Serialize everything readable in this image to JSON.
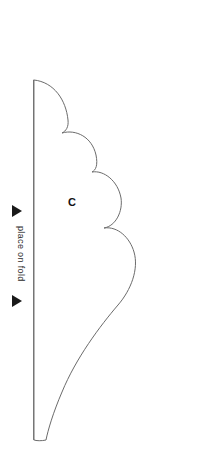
{
  "document": {
    "type": "sewing-pattern-piece",
    "background_color": "#ffffff",
    "width": 202,
    "height": 472
  },
  "pattern_piece": {
    "label": "C",
    "label_x": 71,
    "label_y": 203,
    "outline_color": "#6b6b6b",
    "outline_width": 1,
    "fill": "none",
    "description": "scalloped cloud-shaped half pattern piece cut on fold"
  },
  "fold": {
    "instruction_text": "place on fold",
    "text_color": "#2b2b2b",
    "line_color": "#8a8a8a",
    "line_x": 34,
    "line_top_y": 80,
    "line_bottom_y": 440,
    "arrow_color": "#1a1a1a",
    "arrow_glyph": "▶",
    "top_arrow": {
      "x": 12,
      "y": 210
    },
    "bottom_arrow": {
      "x": 12,
      "y": 300
    },
    "text_x": 14,
    "text_y": 228,
    "text_rotation_deg": 90
  },
  "geometry": {
    "fold_edge": {
      "x": 34,
      "y_top": 80,
      "y_bottom": 440
    },
    "max_width_x": 138,
    "lobe_valleys": [
      {
        "x": 62,
        "y": 133
      },
      {
        "x": 92,
        "y": 172
      },
      {
        "x": 104,
        "y": 228
      }
    ],
    "outline_path": "M 34 80 C 54 82 66 100 68 120 C 68.8 127 66 131 62 133 C 76 129 92 137 96 155 C 98 165 96 170 92 172 C 104 170 118 181 121 198 C 123 211 116 226 104 228 C 118 226 130 238 134 252 C 139 269 131 290 118 305 C 100 326 76 358 62 392 C 53 413 48 430 46 440 C 42 441 36 441 34 440 Z"
  }
}
